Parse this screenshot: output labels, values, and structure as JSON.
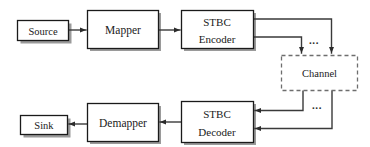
{
  "diagram": {
    "background_color": "#ffffff",
    "line_color": "#3a3a3a",
    "box_fill": "#ffffff",
    "box_border_color": "#1a1a1a",
    "shadow_color": "#9a9a9a",
    "dashed_border_color": "#6e6e6e",
    "blocks": [
      {
        "id": "source",
        "label": "Source",
        "x": 17,
        "y": 20,
        "w": 51,
        "h": 20,
        "style": "solid",
        "lines": 1
      },
      {
        "id": "mapper",
        "label": "Mapper",
        "x": 87,
        "y": 10,
        "w": 71,
        "h": 38,
        "style": "solid",
        "lines": 1
      },
      {
        "id": "stbc-encoder",
        "label": "STBC Encoder",
        "line1": "STBC",
        "line2": "Encoder",
        "x": 181,
        "y": 10,
        "w": 72,
        "h": 38,
        "style": "solid",
        "lines": 2
      },
      {
        "id": "channel",
        "label": "Channel",
        "x": 281,
        "y": 55,
        "w": 76,
        "h": 35,
        "style": "dashed",
        "lines": 1
      },
      {
        "id": "stbc-decoder",
        "label": "STBC Decoder",
        "line1": "STBC",
        "line2": "Decoder",
        "x": 181,
        "y": 101,
        "w": 72,
        "h": 41,
        "style": "solid",
        "lines": 2
      },
      {
        "id": "demapper",
        "label": "Demapper",
        "x": 87,
        "y": 103,
        "w": 71,
        "h": 38,
        "style": "solid",
        "lines": 1
      },
      {
        "id": "sink",
        "label": "Sink",
        "x": 20,
        "y": 115,
        "w": 47,
        "h": 19,
        "style": "solid",
        "lines": 1
      }
    ],
    "ellipses": [
      {
        "id": "tx-antenna-ellipsis",
        "label": "...",
        "x": 314,
        "y": 41
      },
      {
        "id": "rx-antenna-ellipsis",
        "label": "...",
        "x": 317,
        "y": 106
      }
    ],
    "connections": [
      {
        "id": "source-to-mapper",
        "from": "source",
        "to": "mapper",
        "arrow": true
      },
      {
        "id": "mapper-to-encoder",
        "from": "mapper",
        "to": "stbc-encoder",
        "arrow": true
      },
      {
        "id": "encoder-to-channel-1",
        "from": "stbc-encoder",
        "to": "channel",
        "arrow": true
      },
      {
        "id": "encoder-to-channel-n",
        "from": "stbc-encoder",
        "to": "channel",
        "arrow": true
      },
      {
        "id": "channel-to-decoder-1",
        "from": "channel",
        "to": "stbc-decoder",
        "arrow": true
      },
      {
        "id": "channel-to-decoder-n",
        "from": "channel",
        "to": "stbc-decoder",
        "arrow": true
      },
      {
        "id": "decoder-to-demapper",
        "from": "stbc-decoder",
        "to": "demapper",
        "arrow": true
      },
      {
        "id": "demapper-to-sink",
        "from": "demapper",
        "to": "sink",
        "arrow": true
      }
    ]
  }
}
